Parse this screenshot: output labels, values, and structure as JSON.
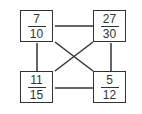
{
  "diagram": {
    "boxes": [
      {
        "id": "top-left",
        "numerator": "7",
        "denominator": "10"
      },
      {
        "id": "top-right",
        "numerator": "27",
        "denominator": "30"
      },
      {
        "id": "bottom-left",
        "numerator": "11",
        "denominator": "15"
      },
      {
        "id": "bottom-right",
        "numerator": "5",
        "denominator": "12"
      }
    ],
    "connections": [
      [
        "top-left",
        "top-right"
      ],
      [
        "top-left",
        "bottom-left"
      ],
      [
        "top-right",
        "bottom-right"
      ],
      [
        "bottom-left",
        "bottom-right"
      ],
      [
        "top-left",
        "bottom-right"
      ],
      [
        "top-right",
        "bottom-left"
      ]
    ],
    "colors": {
      "stroke": "#333333",
      "background": "#ffffff"
    }
  }
}
